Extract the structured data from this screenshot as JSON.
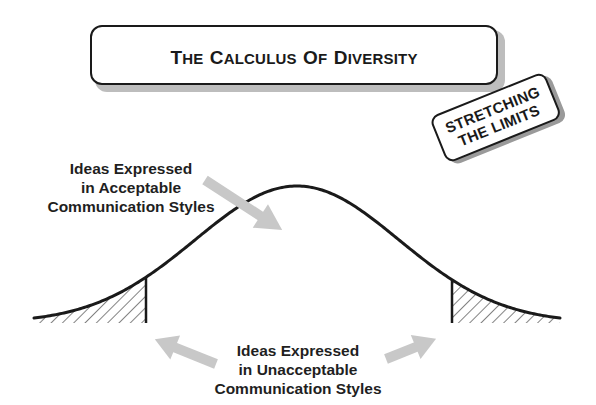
{
  "title": {
    "words": [
      {
        "cap": "T",
        "rest": "he"
      },
      {
        "cap": "C",
        "rest": "alculus"
      },
      {
        "cap": "O",
        "rest": "f"
      },
      {
        "cap": "D",
        "rest": "iversity"
      }
    ],
    "full": "THE CALCULUS OF DIVERSITY"
  },
  "badge": {
    "line1": "STRETCHING",
    "line2": "THE LIMITS"
  },
  "labels": {
    "acceptable": [
      "Ideas Expressed",
      "in Acceptable",
      "Communication Styles"
    ],
    "unacceptable": [
      "Ideas Expressed",
      "in Unacceptable",
      "Communication Styles"
    ]
  },
  "curve": {
    "type": "normal-distribution",
    "shaded_tails": [
      "left",
      "right"
    ],
    "line_color": "#1a1a1a",
    "arrow_color": "#c8c8c8"
  }
}
